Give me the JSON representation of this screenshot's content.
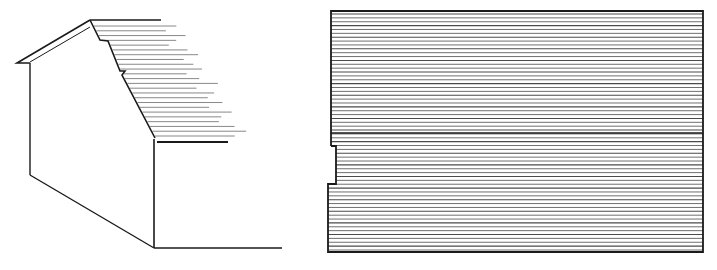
{
  "figures": [
    {
      "id": "left",
      "description": "perspective view of gabled wall with horizontal siding on sloped roof face",
      "stroke_color": "#1a1a1a",
      "hatch_color": "#6a6a6a",
      "outline": {
        "roof_top_line": [
          [
            90,
            20
          ],
          [
            161,
            20
          ]
        ],
        "roof_outer": [
          [
            90,
            20
          ],
          [
            17,
            63
          ],
          [
            30,
            63
          ]
        ],
        "roof_inner": [
          [
            90,
            27
          ],
          [
            30,
            62
          ]
        ],
        "left_wall": [
          [
            30,
            63
          ],
          [
            30,
            175
          ]
        ],
        "bottom_diagonal": [
          [
            30,
            175
          ],
          [
            154,
            248
          ]
        ],
        "front_edge": [
          [
            154,
            139
          ],
          [
            154,
            248
          ]
        ],
        "ground_line": [
          [
            154,
            248
          ],
          [
            282,
            248
          ]
        ],
        "slope_profile": [
          [
            90,
            20
          ],
          [
            100,
            40
          ],
          [
            108,
            41
          ],
          [
            120,
            71
          ],
          [
            125,
            71
          ],
          [
            122,
            75
          ],
          [
            155,
            138
          ]
        ],
        "eave_line": [
          [
            157,
            142
          ],
          [
            228,
            142
          ]
        ]
      },
      "hatch": {
        "y_start": 26,
        "y_end": 136,
        "count": 24
      }
    },
    {
      "id": "right",
      "description": "elevation panel with horizontal siding lines and a notch on the left edge",
      "stroke_color": "#1a1a1a",
      "hatch_color": "#4a4a4a",
      "frame": {
        "left": 331,
        "top": 11,
        "right": 703,
        "bottom": 252
      },
      "notch": {
        "y_top": 146,
        "y_bottom": 184,
        "inset_x": 336,
        "lower_left_x": 328
      },
      "divider_y": 133,
      "hatch": {
        "y_start": 14,
        "y_end": 250,
        "count": 62
      }
    }
  ]
}
